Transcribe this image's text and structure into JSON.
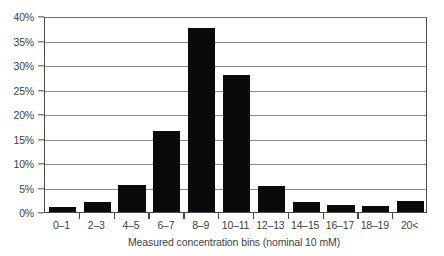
{
  "chart_data": {
    "type": "bar",
    "title": "",
    "xlabel": "Measured concentration bins (nominal 10 mM)",
    "ylabel": "",
    "categories": [
      "0–1",
      "2–3",
      "4–5",
      "6–7",
      "8–9",
      "10–11",
      "12–13",
      "14–15",
      "16–17",
      "18–19",
      "20<"
    ],
    "values": [
      1.1,
      2.1,
      5.6,
      16.5,
      37.5,
      28.0,
      5.3,
      2.0,
      1.5,
      1.2,
      2.3
    ],
    "ylim": [
      0,
      40
    ],
    "ytick_values": [
      0,
      5,
      10,
      15,
      20,
      25,
      30,
      35,
      40
    ],
    "ytick_labels": [
      "0%",
      "5%",
      "10%",
      "15%",
      "20%",
      "25%",
      "30%",
      "35%",
      "40%"
    ],
    "grid": true,
    "grid_axis": "y",
    "legend": "none",
    "bar_color": "#0a0a0a",
    "axis_color": "#4a4a4a",
    "grid_color": "#8b8b8b",
    "background_color": "#ffffff"
  }
}
